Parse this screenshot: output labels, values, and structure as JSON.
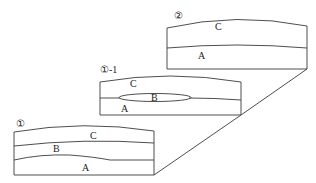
{
  "diagram": {
    "type": "stratigraphic cross-section sequence",
    "panels": [
      {
        "id": "panel-1",
        "title": "①",
        "layers": [
          "C",
          "B",
          "A"
        ]
      },
      {
        "id": "panel-1-1",
        "title": "①-1",
        "layers": [
          "C",
          "B",
          "A"
        ],
        "note_layer_B_shape": "lens"
      },
      {
        "id": "panel-2",
        "title": "②",
        "layers": [
          "C",
          "A"
        ]
      }
    ],
    "connector": "diagonal line joining bottom-right corners of panels",
    "colors": {
      "line": "#3a3a3a",
      "text": "#222222",
      "background": "#ffffff"
    }
  }
}
